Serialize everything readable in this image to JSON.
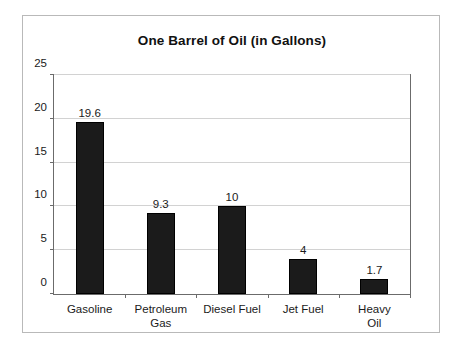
{
  "chart_data": {
    "type": "bar",
    "title": "One Barrel of Oil (in Gallons)",
    "xlabel": "",
    "ylabel": "",
    "categories": [
      "Gasoline",
      "Petroleum\nGas",
      "Diesel Fuel",
      "Jet Fuel",
      "Heavy Oil"
    ],
    "values": [
      19.6,
      9.3,
      10,
      4,
      1.7
    ],
    "value_labels": [
      "19.6",
      "9.3",
      "10",
      "4",
      "1.7"
    ],
    "ylim": [
      0,
      25
    ],
    "y_ticks": [
      0,
      5,
      10,
      15,
      20,
      25
    ],
    "y_tick_labels": [
      "0",
      "5",
      "10",
      "15",
      "20",
      "25"
    ],
    "grid": true,
    "legend": false,
    "bar_color": "#1b1b1b",
    "gridline_color": "#d2d2d2",
    "axis_color": "#6b6b6b",
    "background_color": "#ffffff"
  }
}
